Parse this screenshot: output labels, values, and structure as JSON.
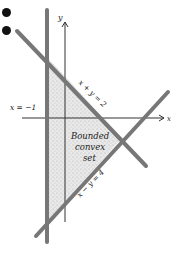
{
  "bullets": [
    {
      "label": "bullet-1"
    },
    {
      "label": "bullet-2"
    }
  ],
  "labels": {
    "y_axis": "y",
    "x_axis": "x",
    "line_vertical": "x = −1",
    "line_x_plus_y": "x + y = 2",
    "line_x_minus_y": "x − y = 4",
    "region_line1": "Bounded",
    "region_line2": "convex",
    "region_line3": "set"
  },
  "colors": {
    "band": "#6a6a6a",
    "axis": "#333333",
    "shade": "#d4d4d4",
    "text": "#222222"
  }
}
